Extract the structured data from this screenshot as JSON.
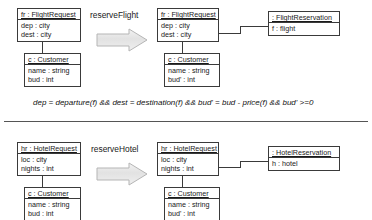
{
  "diagram": {
    "rules": [
      {
        "name": "reserveFlight",
        "operation_label": "reserveFlight",
        "arrow_icon": "block-arrow-right-icon",
        "lhs": {
          "request": {
            "header": "fr : FlightRequest",
            "header_name": "fr",
            "header_type": ": FlightRequest",
            "attributes": [
              "dep : city",
              "dest : city"
            ]
          },
          "customer": {
            "header": "c : Customer",
            "header_name": "c",
            "header_type": ": Customer",
            "attributes": [
              "name : string",
              "bud : int"
            ]
          }
        },
        "rhs": {
          "request": {
            "header": "fr : FlightRequest",
            "header_name": "fr",
            "header_type": ": FlightRequest",
            "attributes": [
              "dep : city",
              "dest : city"
            ]
          },
          "customer": {
            "header": "c : Customer",
            "header_name": "c",
            "header_type": ": Customer",
            "attributes": [
              "name : string",
              "bud' : int"
            ]
          },
          "reservation": {
            "header": ": FlightReservation",
            "header_name": "",
            "header_type": ": FlightReservation",
            "attributes": [
              "f : flight"
            ]
          }
        }
      },
      {
        "name": "reserveHotel",
        "operation_label": "reserveHotel",
        "arrow_icon": "block-arrow-right-icon",
        "lhs": {
          "request": {
            "header": "hr : HotelRequest",
            "header_name": "hr",
            "header_type": ": HotelRequest",
            "attributes": [
              "loc : city",
              "nights : int"
            ]
          },
          "customer": {
            "header": "c : Customer",
            "header_name": "c",
            "header_type": ": Customer",
            "attributes": [
              "name : string",
              "bud : int"
            ]
          }
        },
        "rhs": {
          "request": {
            "header": "hr : HotelRequest",
            "header_name": "hr",
            "header_type": ": HotelRequest",
            "attributes": [
              "loc : city",
              "nights : int"
            ]
          },
          "customer": {
            "header": "c : Customer",
            "header_name": "c",
            "header_type": ": Customer",
            "attributes": [
              "name : string",
              "bud' : int"
            ]
          },
          "reservation": {
            "header": ": HotelReservation",
            "header_name": "",
            "header_type": ": HotelReservation",
            "attributes": [
              "h : hotel"
            ]
          }
        }
      }
    ],
    "condition": "dep = departure(f) && dest = destination(f) && bud' = bud - price(f) && bud' >=0",
    "colors": {
      "box_border": "#3a3a3a",
      "box_fill": "#ffffff",
      "text": "#1a1a1a",
      "arrow_fill": "#e8e8e8",
      "arrow_border": "#b0b0b0",
      "separator": "#555555",
      "background": "#ffffff"
    }
  }
}
